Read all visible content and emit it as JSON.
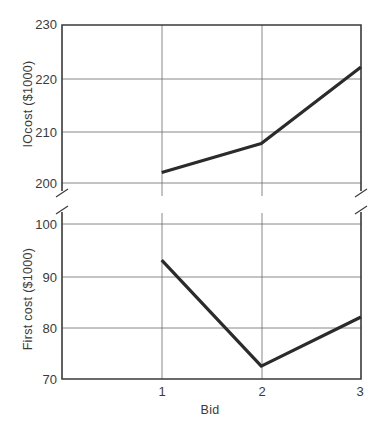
{
  "chart_data": [
    {
      "type": "line",
      "panel": "upper",
      "title": "",
      "xlabel": "",
      "ylabel": "IOcost ($1000)",
      "categories": [
        "1",
        "2",
        "3"
      ],
      "x": [
        1,
        2,
        3
      ],
      "values": [
        202,
        207.5,
        222
      ],
      "ylim": [
        200,
        230
      ],
      "yticks": [
        200,
        210,
        220,
        230
      ],
      "xlim": [
        0,
        3
      ],
      "grid": true,
      "axis_break_below": true
    },
    {
      "type": "line",
      "panel": "lower",
      "title": "",
      "xlabel": "Bid",
      "ylabel": "First cost ($1000)",
      "categories": [
        "1",
        "2",
        "3"
      ],
      "x": [
        1,
        2,
        3
      ],
      "values": [
        93,
        72.5,
        82
      ],
      "ylim": [
        70,
        100
      ],
      "yticks": [
        70,
        80,
        90,
        100
      ],
      "xlim": [
        0,
        3
      ],
      "grid": true,
      "axis_break_above": true
    }
  ],
  "labels": {
    "upper_ylabel": "IOcost ($1000)",
    "lower_ylabel": "First cost ($1000)",
    "xlabel": "Bid",
    "upper_yticks": [
      "230",
      "220",
      "210",
      "200"
    ],
    "lower_yticks": [
      "100",
      "90",
      "80",
      "70"
    ],
    "xticks": [
      "1",
      "2",
      "3"
    ]
  }
}
